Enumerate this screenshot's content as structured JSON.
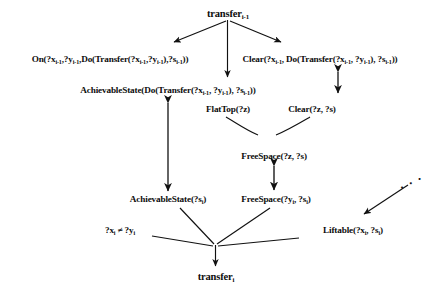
{
  "figure": {
    "type": "proof-tree-diagram",
    "background_color": "#ffffff",
    "ink_color": "#111111"
  },
  "nodes": {
    "root": {
      "label_base": "transfer",
      "label_sub": "i-1",
      "full_text": "transfer(i-1)"
    },
    "on_left": {
      "full_text": "On(?x(i-1),?y(i-1),Do(Transfer(?x(i-1),?y(i-1)),?s(i-1)))",
      "parts": [
        {
          "t": "On(?x"
        },
        {
          "s": "i-1"
        },
        {
          "t": ",?y"
        },
        {
          "s": "i-1"
        },
        {
          "t": ",Do(Transfer(?x"
        },
        {
          "s": "i-1"
        },
        {
          "t": ",?y"
        },
        {
          "s": "i-1"
        },
        {
          "t": "),?s"
        },
        {
          "s": "i-1"
        },
        {
          "t": "))"
        }
      ]
    },
    "clear_right": {
      "full_text": "Clear(?x(i-1), Do(Transfer(?x(i-1), ?y(i-1)), ?s(i-1)))"
    },
    "achievable_state_prev": {
      "full_text": "AchievableState(Do(Transfer(?x(i-1), ?y(i-1)), ?s(i-1)))"
    },
    "flattop": {
      "full_text": "FlatTop(?z)"
    },
    "clear_z": {
      "full_text": "Clear(?z, ?s)"
    },
    "freespace_z": {
      "full_text": "FreeSpace(?z, ?s)"
    },
    "achievable_state_i": {
      "full_text": "AchievableState(?s(i))"
    },
    "freespace_y": {
      "full_text": "FreeSpace(?y(i), ?s(i))"
    },
    "not_equal": {
      "full_text": "?x(i) ≠ ?y(i)"
    },
    "liftable": {
      "full_text": "Liftable(?x(i), ?s(i))"
    },
    "goal": {
      "label_base": "transfer",
      "label_sub": "i",
      "full_text": "transfer(i)"
    },
    "ellipsis": {
      "full_text": ". . ."
    }
  },
  "edges": [
    {
      "name": "root-to-on-left",
      "kind": "arrow",
      "from": "root",
      "to": "on_left"
    },
    {
      "name": "root-to-achievable-prev",
      "kind": "arrow",
      "from": "root",
      "to": "achievable_state_prev"
    },
    {
      "name": "root-to-clear-right",
      "kind": "arrow",
      "from": "root",
      "to": "clear_right"
    },
    {
      "name": "clear-right-double",
      "kind": "double-arrow",
      "from": "clear_right",
      "to": "clear_right_below"
    },
    {
      "name": "achievable-prev-to-achievable-i",
      "kind": "double-arrow",
      "from": "achievable_state_prev",
      "to": "achievable_state_i"
    },
    {
      "name": "flattop-to-freespace-z",
      "kind": "line",
      "from": "flattop",
      "to": "freespace_z"
    },
    {
      "name": "clear-z-to-freespace-z",
      "kind": "line",
      "from": "clear_z",
      "to": "freespace_z"
    },
    {
      "name": "freespace-z-to-freespace-y",
      "kind": "double-arrow",
      "from": "freespace_z",
      "to": "freespace_y"
    },
    {
      "name": "ellipsis-to-liftable",
      "kind": "arrow",
      "from": "ellipsis",
      "to": "liftable"
    },
    {
      "name": "achievable-i-to-goal",
      "kind": "line",
      "from": "achievable_state_i",
      "to": "goal"
    },
    {
      "name": "freespace-y-to-goal",
      "kind": "line",
      "from": "freespace_y",
      "to": "goal"
    },
    {
      "name": "not-equal-to-goal",
      "kind": "line",
      "from": "not_equal",
      "to": "goal"
    },
    {
      "name": "liftable-to-goal",
      "kind": "line",
      "from": "liftable",
      "to": "goal"
    },
    {
      "name": "junction-to-goal",
      "kind": "arrow",
      "from": "junction",
      "to": "goal"
    }
  ]
}
